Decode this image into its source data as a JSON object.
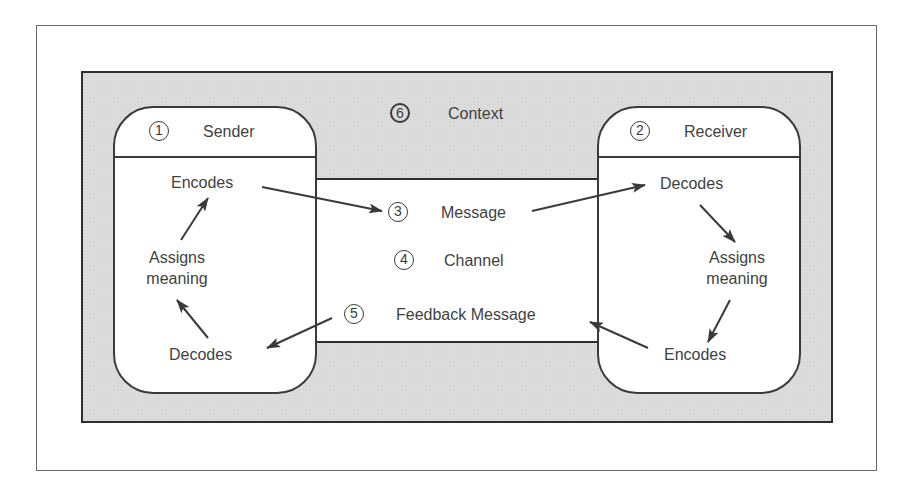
{
  "diagram": {
    "context": {
      "number": "6",
      "label": "Context"
    },
    "sender": {
      "number": "1",
      "label": "Sender",
      "steps": {
        "encodes": "Encodes",
        "assigns_line1": "Assigns",
        "assigns_line2": "meaning",
        "decodes": "Decodes"
      }
    },
    "receiver": {
      "number": "2",
      "label": "Receiver",
      "steps": {
        "decodes": "Decodes",
        "assigns_line1": "Assigns",
        "assigns_line2": "meaning",
        "encodes": "Encodes"
      }
    },
    "channel": {
      "message": {
        "number": "3",
        "label": "Message"
      },
      "channel": {
        "number": "4",
        "label": "Channel"
      },
      "feedback": {
        "number": "5",
        "label": "Feedback Message"
      }
    },
    "colors": {
      "frame": "#6a6a6a",
      "context_fill": "#dcdcdc",
      "line": "#3a3a3a",
      "text": "#3f3f3f"
    }
  }
}
